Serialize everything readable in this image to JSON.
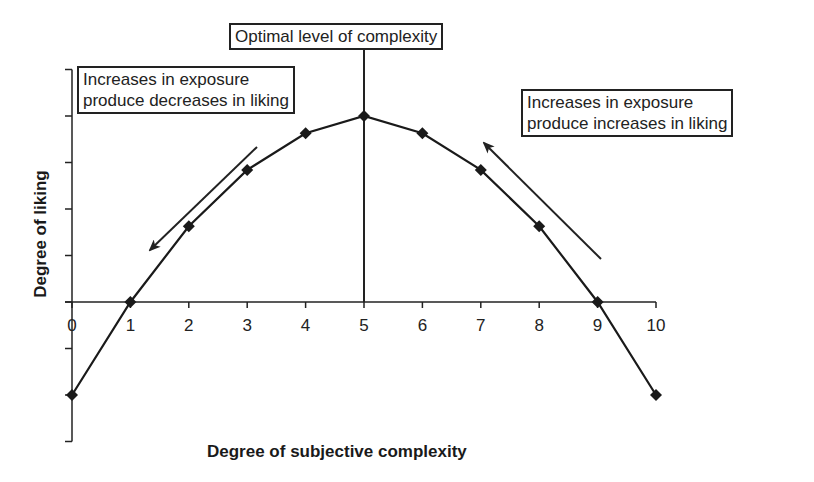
{
  "chart_data": {
    "type": "line",
    "title": "",
    "xlabel": "Degree of subjective complexity",
    "ylabel": "Degree of liking",
    "x": [
      0,
      1,
      2,
      3,
      4,
      5,
      6,
      7,
      8,
      9,
      10
    ],
    "series": [
      {
        "name": "Liking",
        "values": [
          -2,
          0,
          1.63,
          2.84,
          3.63,
          4.0,
          3.63,
          2.84,
          1.63,
          0,
          -2
        ],
        "marker": "diamond",
        "color": "#1a1a1a"
      }
    ],
    "x_ticks": [
      "0",
      "1",
      "2",
      "3",
      "4",
      "5",
      "6",
      "7",
      "8",
      "9",
      "10"
    ],
    "y_ticks_labeled": false,
    "xlim": [
      0,
      10
    ],
    "ylim": [
      -3,
      5
    ],
    "grid": false,
    "legend": null,
    "annotations": [
      {
        "text": "Optimal level of complexity",
        "type": "vertical-line-label",
        "x": 5
      },
      {
        "text": "Increases in exposure\nproduce decreases in liking",
        "type": "box",
        "arrow": "down-left along rising side"
      },
      {
        "text": "Increases in exposure\nproduce increases in liking",
        "type": "box",
        "arrow": "up-left along falling side"
      }
    ]
  },
  "labels": {
    "optimal": "Optimal level of complexity",
    "left_box": "Increases in exposure\nproduce decreases in liking",
    "right_box": "Increases in exposure\nproduce increases in liking",
    "xlabel": "Degree of subjective complexity",
    "ylabel": "Degree of liking"
  }
}
